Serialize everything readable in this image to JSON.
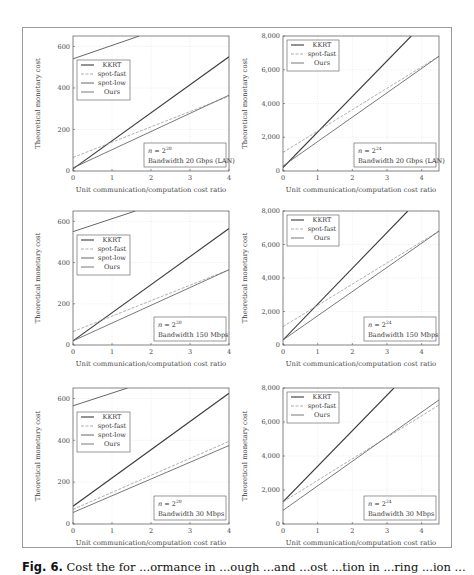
{
  "figure": {
    "caption_label": "Fig. 6.",
    "caption_text": "Cost the for ...ormance in ...ough ...and ...ost ...tion in ...ring ...ion ..."
  },
  "chart_data": [
    {
      "type": "line",
      "panel": "top-left",
      "xlabel": "Unit communication/computation cost ratio",
      "ylabel": "Theoretical monetary cost",
      "xlim": [
        0,
        4
      ],
      "ylim": [
        0,
        650
      ],
      "xticks": [
        "0",
        "1",
        "2",
        "3",
        "4"
      ],
      "yticks": [
        "0",
        "200",
        "400",
        "600"
      ],
      "ytick_values": [
        0,
        200,
        400,
        600
      ],
      "grid": true,
      "annotation": [
        "n = 2^20",
        "Bandwidth 20 Gbps (LAN)"
      ],
      "legend": [
        "KKRT",
        "spot-fast",
        "spot-low",
        "Ours"
      ],
      "series": [
        {
          "name": "KKRT",
          "x": [
            0,
            4
          ],
          "y": [
            10,
            550
          ]
        },
        {
          "name": "spot-fast",
          "x": [
            0,
            4
          ],
          "y": [
            65,
            360
          ]
        },
        {
          "name": "spot-low",
          "x": [
            0,
            1.7
          ],
          "y": [
            540,
            650
          ]
        },
        {
          "name": "Ours",
          "x": [
            0,
            4
          ],
          "y": [
            15,
            365
          ]
        }
      ]
    },
    {
      "type": "line",
      "panel": "top-right",
      "xlabel": "Unit communication/computation cost ratio",
      "ylabel": "Theoretical monetary cost",
      "xlim": [
        0,
        4.5
      ],
      "ylim": [
        0,
        8000
      ],
      "xticks": [
        "0",
        "1",
        "2",
        "3",
        "4"
      ],
      "yticks": [
        "0",
        "2,000",
        "4,000",
        "6,000",
        "8,000"
      ],
      "ytick_values": [
        0,
        2000,
        4000,
        6000,
        8000
      ],
      "grid": true,
      "annotation": [
        "n = 2^24",
        "Bandwidth 20 Gbps (LAN)"
      ],
      "legend": [
        "KKRT",
        "spot-fast",
        "Ours"
      ],
      "series": [
        {
          "name": "KKRT",
          "x": [
            0,
            3.7
          ],
          "y": [
            200,
            8000
          ]
        },
        {
          "name": "spot-fast",
          "x": [
            0,
            4.5
          ],
          "y": [
            1100,
            6800
          ]
        },
        {
          "name": "Ours",
          "x": [
            0,
            4.5
          ],
          "y": [
            300,
            6800
          ]
        }
      ]
    },
    {
      "type": "line",
      "panel": "middle-left",
      "xlabel": "Unit communication/computation cost ratio",
      "ylabel": "Theoretical monetary cost",
      "xlim": [
        0,
        4
      ],
      "ylim": [
        0,
        650
      ],
      "xticks": [
        "0",
        "1",
        "2",
        "3",
        "4"
      ],
      "yticks": [
        "0",
        "200",
        "400",
        "600"
      ],
      "ytick_values": [
        0,
        200,
        400,
        600
      ],
      "grid": true,
      "annotation": [
        "n = 2^20",
        "Bandwidth 150 Mbps"
      ],
      "legend": [
        "KKRT",
        "spot-fast",
        "spot-low",
        "Ours"
      ],
      "series": [
        {
          "name": "KKRT",
          "x": [
            0,
            4
          ],
          "y": [
            20,
            565
          ]
        },
        {
          "name": "spot-fast",
          "x": [
            0,
            4
          ],
          "y": [
            65,
            365
          ]
        },
        {
          "name": "spot-low",
          "x": [
            0,
            1.6
          ],
          "y": [
            550,
            650
          ]
        },
        {
          "name": "Ours",
          "x": [
            0,
            4
          ],
          "y": [
            20,
            365
          ]
        }
      ]
    },
    {
      "type": "line",
      "panel": "middle-right",
      "xlabel": "Unit communication/computation cost ratio",
      "ylabel": "Theoretical monetary cost",
      "xlim": [
        0,
        4.5
      ],
      "ylim": [
        0,
        8000
      ],
      "xticks": [
        "0",
        "1",
        "2",
        "3",
        "4"
      ],
      "yticks": [
        "0",
        "2,000",
        "4,000",
        "6,000",
        "8,000"
      ],
      "ytick_values": [
        0,
        2000,
        4000,
        6000,
        8000
      ],
      "grid": true,
      "annotation": [
        "n = 2^24",
        "Bandwidth 150 Mbps"
      ],
      "legend": [
        "KKRT",
        "spot-fast",
        "Ours"
      ],
      "series": [
        {
          "name": "KKRT",
          "x": [
            0,
            3.6
          ],
          "y": [
            300,
            8000
          ]
        },
        {
          "name": "spot-fast",
          "x": [
            0,
            4.5
          ],
          "y": [
            1100,
            6800
          ]
        },
        {
          "name": "Ours",
          "x": [
            0,
            4.5
          ],
          "y": [
            300,
            6800
          ]
        }
      ]
    },
    {
      "type": "line",
      "panel": "bottom-left",
      "xlabel": "Unit communication/computation cost ratio",
      "ylabel": "Theoretical monetary cost",
      "xlim": [
        0,
        4
      ],
      "ylim": [
        0,
        650
      ],
      "xticks": [
        "0",
        "1",
        "2",
        "3",
        "4"
      ],
      "yticks": [
        "0",
        "200",
        "400",
        "600"
      ],
      "ytick_values": [
        0,
        200,
        400,
        600
      ],
      "grid": true,
      "annotation": [
        "n = 2^20",
        "Bandwidth 30 Mbps"
      ],
      "legend": [
        "KKRT",
        "spot-fast",
        "spot-low",
        "Ours"
      ],
      "series": [
        {
          "name": "KKRT",
          "x": [
            0,
            4
          ],
          "y": [
            85,
            625
          ]
        },
        {
          "name": "spot-fast",
          "x": [
            0,
            4
          ],
          "y": [
            70,
            395
          ]
        },
        {
          "name": "spot-low",
          "x": [
            0,
            1.4
          ],
          "y": [
            565,
            650
          ]
        },
        {
          "name": "Ours",
          "x": [
            0,
            4
          ],
          "y": [
            55,
            375
          ]
        }
      ]
    },
    {
      "type": "line",
      "panel": "bottom-right",
      "xlabel": "Unit communication/computation cost ratio",
      "ylabel": "Theoretical monetary cost",
      "xlim": [
        0,
        4.5
      ],
      "ylim": [
        0,
        8000
      ],
      "xticks": [
        "0",
        "1",
        "2",
        "3",
        "4"
      ],
      "yticks": [
        "0",
        "2,000",
        "4,000",
        "6,000",
        "8,000"
      ],
      "ytick_values": [
        0,
        2000,
        4000,
        6000,
        8000
      ],
      "grid": true,
      "annotation": [
        "n = 2^24",
        "Bandwidth 30 Mbps"
      ],
      "legend": [
        "KKRT",
        "spot-fast",
        "Ours"
      ],
      "series": [
        {
          "name": "KKRT",
          "x": [
            0,
            3.2
          ],
          "y": [
            1300,
            8000
          ]
        },
        {
          "name": "spot-fast",
          "x": [
            0,
            4.5
          ],
          "y": [
            1300,
            7000
          ]
        },
        {
          "name": "Ours",
          "x": [
            0,
            4.5
          ],
          "y": [
            800,
            7300
          ]
        }
      ]
    }
  ],
  "styles": {
    "KKRT": {
      "color": "#3a3a3a",
      "width": 1.1,
      "dash": ""
    },
    "spot-fast": {
      "color": "#9a9a9a",
      "width": 0.8,
      "dash": "3,1.5"
    },
    "spot-low": {
      "color": "#555555",
      "width": 0.9,
      "dash": ""
    },
    "Ours": {
      "color": "#6a6a6a",
      "width": 0.9,
      "dash": ""
    }
  }
}
